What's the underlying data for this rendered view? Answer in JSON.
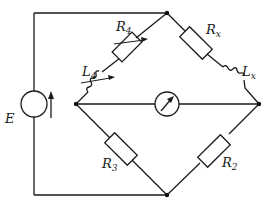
{
  "diagram": {
    "type": "AC bridge circuit (Maxwell inductance bridge)",
    "source": {
      "label": "E",
      "symbol": "current-source-circle-with-arrow"
    },
    "galvanometer": {
      "symbol": "meter-circle-with-arrow"
    },
    "components": [
      {
        "id": "R4",
        "main": "R",
        "sub": "4",
        "kind": "variable-resistor",
        "branch": "left-node to top-node"
      },
      {
        "id": "L4",
        "main": "L",
        "sub": "4",
        "kind": "variable-inductor",
        "branch": "left-node to top-node"
      },
      {
        "id": "Rx",
        "main": "R",
        "sub": "x",
        "kind": "resistor",
        "branch": "top-node to right-node"
      },
      {
        "id": "Lx",
        "main": "L",
        "sub": "x",
        "kind": "inductor",
        "branch": "top-node to right-node"
      },
      {
        "id": "R3",
        "main": "R",
        "sub": "3",
        "kind": "resistor",
        "branch": "left-node to bottom-node"
      },
      {
        "id": "R2",
        "main": "R",
        "sub": "2",
        "kind": "resistor",
        "branch": "right-node to bottom-node"
      }
    ],
    "nodes": [
      "top",
      "left",
      "right",
      "bottom"
    ]
  }
}
